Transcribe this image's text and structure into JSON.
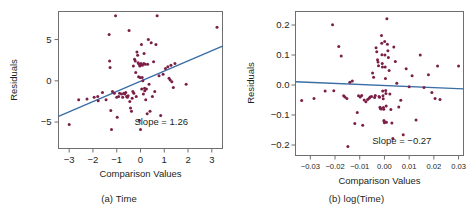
{
  "figure": {
    "panels": [
      {
        "id": "a",
        "caption": "(a) Time"
      },
      {
        "id": "b",
        "caption": "(b) log(Time)"
      }
    ],
    "colors": {
      "point": "#7b1f47",
      "fit_line": "#3a6ea5",
      "frame": "#6f6f6f",
      "text": "#231f20",
      "background": "#ffffff"
    }
  },
  "chart_data": [
    {
      "type": "scatter",
      "id": "panel-a",
      "title": "(a) Time",
      "xlabel": "Comparison Values",
      "ylabel": "Residuals",
      "xlim": [
        -3.45,
        3.45
      ],
      "ylim": [
        -8.2,
        8.4
      ],
      "xticks": [
        -3,
        -2,
        -1,
        0,
        1,
        2,
        3
      ],
      "xticklabels": [
        "-3",
        "-2",
        "-1",
        "0",
        "1",
        "2",
        "3"
      ],
      "yticks": [
        5,
        0,
        -5
      ],
      "yticklabels": [
        "5",
        "0",
        "-5"
      ],
      "grid": false,
      "legend": "none",
      "annotations": [
        {
          "text": "Slope = 1.26",
          "x": 2.0,
          "y": -5.3
        }
      ],
      "fit_line": {
        "slope": 1.26,
        "intercept": -0.1,
        "x_start": -3.45,
        "y_start": -4.3,
        "x_end": 3.45,
        "y_end": 4.2
      },
      "x": [
        -3.0,
        -2.6,
        -2.25,
        -1.95,
        -1.8,
        -1.78,
        -1.6,
        -1.45,
        -1.32,
        -1.3,
        -1.28,
        -1.25,
        -1.22,
        -1.18,
        -1.1,
        -1.05,
        -1.0,
        -0.98,
        -0.92,
        -0.88,
        -0.8,
        -0.75,
        -0.7,
        -0.66,
        -0.62,
        -0.58,
        -0.55,
        -0.52,
        -0.48,
        -0.45,
        -0.42,
        -0.38,
        -0.35,
        -0.32,
        -0.3,
        -0.28,
        -0.25,
        -0.22,
        -0.2,
        -0.18,
        -0.15,
        -0.12,
        -0.1,
        -0.08,
        -0.06,
        -0.05,
        -0.03,
        -0.02,
        0.0,
        0.02,
        0.04,
        0.05,
        0.07,
        0.08,
        0.1,
        0.12,
        0.14,
        0.15,
        0.17,
        0.18,
        0.2,
        0.22,
        0.25,
        0.28,
        0.3,
        0.33,
        0.36,
        0.4,
        0.45,
        0.5,
        0.55,
        0.6,
        0.65,
        0.7,
        0.78,
        0.85,
        0.95,
        1.05,
        1.15,
        1.2,
        1.25,
        1.28,
        1.32,
        1.38,
        1.45,
        1.92,
        3.22
      ],
      "y": [
        -5.3,
        -2.3,
        -2.2,
        -2.0,
        -1.9,
        -2.4,
        -1.4,
        -2.3,
        5.6,
        2.4,
        1.6,
        -3.6,
        -5.9,
        -1.3,
        -1.5,
        7.9,
        -2.0,
        -4.4,
        -1.9,
        -1.5,
        -1.6,
        -2.0,
        -1.5,
        -1.6,
        -1.4,
        -1.9,
        -2.0,
        -1.8,
        6.1,
        -2.5,
        -3.3,
        -3.7,
        -2.1,
        -1.3,
        1.8,
        -1.5,
        2.6,
        2.4,
        1.0,
        -1.9,
        3.5,
        3.1,
        2.2,
        0.5,
        2.0,
        -4.8,
        1.8,
        0.4,
        -5.9,
        2.1,
        4.4,
        -1.0,
        0.4,
        1.9,
        0.0,
        -1.6,
        2.1,
        3.3,
        -0.9,
        -1.2,
        2.0,
        -2.3,
        -1.0,
        -4.0,
        2.0,
        5.0,
        -0.4,
        -3.7,
        4.6,
        -1.9,
        2.3,
        -1.3,
        4.4,
        7.9,
        0.6,
        -4.2,
        0.8,
        1.5,
        1.7,
        0.3,
        0.1,
        1.9,
        -0.1,
        -0.8,
        2.1,
        -0.4,
        6.5
      ]
    },
    {
      "type": "scatter",
      "id": "panel-b",
      "title": "(b) log(Time)",
      "xlabel": "Comparison Values",
      "ylabel": "Residuals",
      "xlim": [
        -0.036,
        0.032
      ],
      "ylim": [
        -0.235,
        0.245
      ],
      "xticks": [
        -0.03,
        -0.02,
        -0.01,
        0.0,
        0.01,
        0.02,
        0.03
      ],
      "xticklabels": [
        "-0.03",
        "-0.02",
        "-0.01",
        "0.00",
        "0.01",
        "0.02",
        "0.03"
      ],
      "yticks": [
        0.2,
        0.1,
        0.0,
        -0.1,
        -0.2
      ],
      "yticklabels": [
        "0.2",
        "0.1",
        "0.0",
        "-0.1",
        "-0.2"
      ],
      "grid": false,
      "legend": "none",
      "annotations": [
        {
          "text": "Slope = −0.27",
          "x": 0.019,
          "y": -0.197
        }
      ],
      "fit_line": {
        "slope": -0.27,
        "intercept": 0.0,
        "x_start": -0.036,
        "y_start": 0.011,
        "x_end": 0.032,
        "y_end": -0.013
      },
      "x": [
        -0.0335,
        -0.0285,
        -0.024,
        -0.021,
        -0.0205,
        -0.0185,
        -0.0175,
        -0.0165,
        -0.016,
        -0.0152,
        -0.0148,
        -0.014,
        -0.013,
        -0.012,
        -0.011,
        -0.0105,
        -0.0098,
        -0.0092,
        -0.0088,
        -0.0082,
        -0.0075,
        -0.0068,
        -0.0062,
        -0.0058,
        -0.0052,
        -0.0048,
        -0.0044,
        -0.004,
        -0.0037,
        -0.0034,
        -0.0031,
        -0.0028,
        -0.0026,
        -0.0024,
        -0.0022,
        -0.002,
        -0.0018,
        -0.0016,
        -0.0014,
        -0.0012,
        -0.0011,
        -0.001,
        -0.0009,
        -0.0008,
        -0.0007,
        -0.0006,
        -0.0005,
        -0.0004,
        -0.0003,
        -0.0002,
        -0.0001,
        0.0,
        0.0001,
        0.0002,
        0.0003,
        0.0004,
        0.0005,
        0.0006,
        0.0007,
        0.0008,
        0.001,
        0.0012,
        0.0014,
        0.0016,
        0.0019,
        0.0022,
        0.0026,
        0.003,
        0.0034,
        0.0038,
        0.0044,
        0.005,
        0.0058,
        0.0066,
        0.0076,
        0.0088,
        0.01,
        0.0112,
        0.0128,
        0.0145,
        0.016,
        0.0178,
        0.0192,
        0.0205,
        0.0215,
        0.0225,
        0.03
      ],
      "y": [
        -0.052,
        -0.045,
        -0.02,
        0.201,
        -0.019,
        0.128,
        0.097,
        -0.036,
        -0.04,
        -0.045,
        -0.205,
        0.009,
        0.013,
        -0.128,
        -0.092,
        -0.036,
        -0.04,
        -0.035,
        -0.134,
        -0.05,
        -0.056,
        -0.048,
        -0.044,
        -0.04,
        -0.038,
        0.04,
        0.026,
        -0.042,
        -0.035,
        0.124,
        0.111,
        0.084,
        0.077,
        0.064,
        -0.038,
        -0.041,
        -0.074,
        -0.078,
        -0.08,
        0.165,
        0.139,
        0.101,
        0.072,
        0.06,
        -0.02,
        -0.036,
        -0.046,
        -0.075,
        -0.081,
        -0.118,
        -0.122,
        -0.126,
        0.145,
        0.1,
        0.06,
        0.022,
        -0.018,
        -0.028,
        -0.07,
        -0.124,
        0.221,
        0.136,
        0.114,
        0.092,
        0.048,
        -0.03,
        -0.082,
        -0.127,
        -0.178,
        0.127,
        0.078,
        0.006,
        -0.073,
        -0.051,
        -0.166,
        0.054,
        -0.006,
        0.031,
        -0.117,
        0.1,
        -0.008,
        0.034,
        -0.025,
        -0.045,
        0.063,
        -0.048,
        0.063
      ]
    }
  ]
}
